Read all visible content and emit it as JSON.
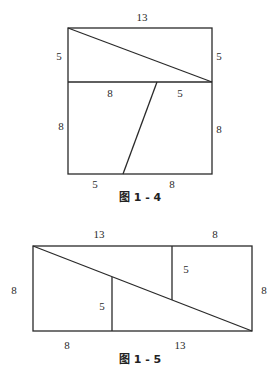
{
  "figures": [
    {
      "id": "fig-1-4",
      "caption": "图 1 - 4",
      "labels": {
        "top": "13",
        "left_upper": "5",
        "right_upper": "5",
        "mid_left": "8",
        "mid_right": "5",
        "left_lower": "8",
        "right_lower": "8",
        "bottom_left": "5",
        "bottom_right": "8"
      },
      "description": "13x13 square cut into two right triangles (13x5 strip, diagonal) and two right trapezoids (13x8 region, slanted cut from 8|5 on top to 5|8 on bottom)"
    },
    {
      "id": "fig-1-5",
      "caption": "图 1 - 5",
      "labels": {
        "top_left": "13",
        "top_right": "8",
        "left": "8",
        "right": "8",
        "inner_upper": "5",
        "inner_lower": "5",
        "bottom_left": "8",
        "bottom_right": "13"
      },
      "description": "8x21 rectangle rearranged from the square pieces with a single diagonal and two vertical cuts of length 5"
    }
  ],
  "style": {
    "line_color": "#2a2a2a",
    "background": "#ffffff"
  }
}
